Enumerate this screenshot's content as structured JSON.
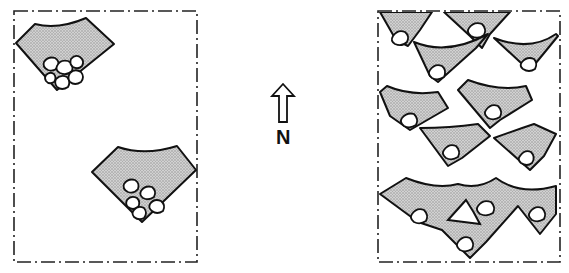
{
  "diagram": {
    "panels": [
      {
        "id": "sparse",
        "description": "Two isolated fan-shaped wave/dune units with clustered cobbles at apex",
        "unit_count": 2
      },
      {
        "id": "dense",
        "description": "Densely packed overlapping fan-shaped units, each with a cobble at apex",
        "unit_count": 13
      }
    ],
    "compass": {
      "label": "N",
      "direction": "up"
    },
    "colors": {
      "line": "#111111",
      "fill_stipple": "#bdbdbd",
      "background": "#ffffff"
    }
  }
}
